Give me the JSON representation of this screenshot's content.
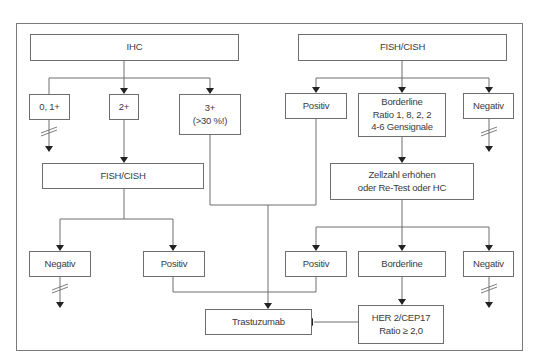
{
  "diagram": {
    "type": "flowchart",
    "colors": {
      "line": "#6e6e6e",
      "text": "#3a3a3a",
      "background": "#ffffff"
    },
    "nodes": {
      "ihc": "IHC",
      "ihc_0_1": "0, 1+",
      "ihc_2": "2+",
      "ihc_3": "3+\n(>30 %!)",
      "fish_left": "FISH/CISH",
      "left_negativ": "Negativ",
      "left_positiv": "Positiv",
      "fish_right": "FISH/CISH",
      "right_positiv": "Positiv",
      "right_borderline": "Borderline\nRatio 1, 8, 2, 2\n4-6 Gensignale",
      "right_negativ": "Negativ",
      "retest": "Zellzahl erhöhen\noder Re-Test oder HC",
      "retest_positiv": "Positiv",
      "retest_borderline": "Borderline",
      "retest_negativ": "Negativ",
      "her2_ratio": "HER 2/CEP17\nRatio ≥ 2,0",
      "trastuzumab": "Trastuzumab"
    },
    "edges": [
      {
        "from": "IHC",
        "to": "0, 1+"
      },
      {
        "from": "IHC",
        "to": "2+"
      },
      {
        "from": "IHC",
        "to": "3+ (>30 %!)"
      },
      {
        "from": "0, 1+",
        "to": "stop",
        "style": "interrupted"
      },
      {
        "from": "2+",
        "to": "FISH/CISH (left)"
      },
      {
        "from": "3+ (>30 %!)",
        "to": "Trastuzumab"
      },
      {
        "from": "FISH/CISH (left)",
        "to": "Negativ (left)"
      },
      {
        "from": "FISH/CISH (left)",
        "to": "Positiv (left)"
      },
      {
        "from": "Negativ (left)",
        "to": "stop",
        "style": "interrupted"
      },
      {
        "from": "Positiv (left)",
        "to": "Trastuzumab"
      },
      {
        "from": "FISH/CISH (right)",
        "to": "Positiv"
      },
      {
        "from": "FISH/CISH (right)",
        "to": "Borderline Ratio 1, 8, 2, 2 4-6 Gensignale"
      },
      {
        "from": "FISH/CISH (right)",
        "to": "Negativ"
      },
      {
        "from": "Negativ",
        "to": "stop",
        "style": "interrupted"
      },
      {
        "from": "Positiv",
        "to": "Trastuzumab"
      },
      {
        "from": "Borderline Ratio 1, 8, 2, 2 4-6 Gensignale",
        "to": "Zellzahl erhöhen oder Re-Test oder HC"
      },
      {
        "from": "Zellzahl erhöhen oder Re-Test oder HC",
        "to": "Positiv (retest)"
      },
      {
        "from": "Zellzahl erhöhen oder Re-Test oder HC",
        "to": "Borderline (retest)"
      },
      {
        "from": "Zellzahl erhöhen oder Re-Test oder HC",
        "to": "Negativ (retest)"
      },
      {
        "from": "Negativ (retest)",
        "to": "stop",
        "style": "interrupted"
      },
      {
        "from": "Positiv (retest)",
        "to": "Trastuzumab"
      },
      {
        "from": "Borderline (retest)",
        "to": "HER 2/CEP17 Ratio ≥ 2,0"
      },
      {
        "from": "HER 2/CEP17 Ratio ≥ 2,0",
        "to": "Trastuzumab"
      }
    ]
  }
}
